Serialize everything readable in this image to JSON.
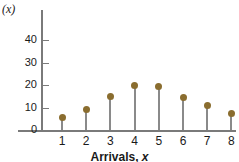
{
  "chart_data": {
    "type": "scatter",
    "title": "",
    "subtitle": "",
    "xlabel": "Arrivals, x",
    "ylabel": "(x)",
    "categories": [
      1,
      2,
      3,
      4,
      5,
      6,
      7,
      8
    ],
    "x": [
      1,
      2,
      3,
      4,
      5,
      6,
      7,
      8
    ],
    "values": [
      5.5,
      9,
      15,
      20,
      19.5,
      14.5,
      11,
      7.5
    ],
    "series": [
      {
        "name": "(x)",
        "values": [
          5.5,
          9,
          15,
          20,
          19.5,
          14.5,
          11,
          7.5
        ]
      }
    ],
    "xlim": [
      0.3,
      8.8
    ],
    "ylim": [
      0,
      46
    ],
    "xticks": [
      1,
      2,
      3,
      4,
      5,
      6,
      7,
      8
    ],
    "xtick_labels": [
      "1",
      "2",
      "3",
      "4",
      "5",
      "6",
      "7",
      "8"
    ],
    "yticks": [
      0,
      10,
      20,
      30,
      40
    ],
    "ytick_labels": [
      "0",
      "10",
      "20",
      "30",
      "40"
    ],
    "grid": false,
    "legend": false,
    "legend_position": "none",
    "marker_color": "#8a6d2f",
    "stem_color": "#8a8a8a",
    "axis_color": "#7a7a7a",
    "background_color": "#ffffff",
    "annotations": []
  },
  "axes": {
    "y_title": "(x)",
    "x_title_text": "Arrivals, ",
    "x_title_var": "x"
  }
}
